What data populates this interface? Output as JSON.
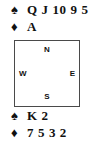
{
  "diagram": {
    "type": "bridge-hand-diagram",
    "line_color": "#4a4a4a",
    "text_color": "#111111",
    "background": "#ffffff"
  },
  "north_hand": {
    "suits": [
      {
        "symbol": "♠",
        "icon": "spade-icon",
        "name": "spades",
        "cards": "Q J 10 9 5"
      },
      {
        "symbol": "♦",
        "icon": "diamond-icon",
        "name": "diamonds",
        "cards": "A"
      }
    ]
  },
  "south_hand": {
    "suits": [
      {
        "symbol": "♠",
        "icon": "spade-icon",
        "name": "spades",
        "cards": "K 2"
      },
      {
        "symbol": "♦",
        "icon": "diamond-icon",
        "name": "diamonds",
        "cards": "7 5 3 2"
      }
    ]
  },
  "compass": {
    "north": "N",
    "south": "S",
    "west": "W",
    "east": "E"
  }
}
